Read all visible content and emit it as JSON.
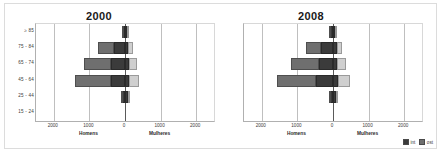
{
  "figure": {
    "border_color": "#dcdcdc",
    "background": "#ffffff"
  },
  "legend": {
    "items": [
      {
        "label": "int",
        "color": "#3b3b3b"
      },
      {
        "label": "ost",
        "color": "#6f6f6f"
      }
    ]
  },
  "axis": {
    "left_caption": "Homens",
    "right_caption": "Mulheres",
    "ticks": [
      "2000",
      "1000",
      "0",
      "1000",
      "2000"
    ],
    "age_groups": [
      "≥ 85",
      "75 - 84",
      "65 - 74",
      "45 - 64",
      "25 - 44",
      "15 - 24"
    ]
  },
  "chart_data": [
    {
      "type": "bar",
      "title": "2000",
      "subtype": "population-pyramid-stacked",
      "categories": [
        "≥ 85",
        "75 - 84",
        "65 - 74",
        "45 - 64",
        "25 - 44",
        "15 - 24"
      ],
      "xlabel": "",
      "ylabel": "",
      "xlim": [
        -2500,
        2500
      ],
      "xticks": [
        -2000,
        -1000,
        0,
        1000,
        2000
      ],
      "grid": true,
      "legend_position": "bottom-right",
      "series": [
        {
          "name": "int",
          "side": "Homens",
          "values": [
            60,
            310,
            380,
            400,
            90,
            0
          ]
        },
        {
          "name": "ost",
          "side": "Homens",
          "values": [
            20,
            450,
            760,
            1010,
            20,
            0
          ]
        },
        {
          "name": "int",
          "side": "Mulheres",
          "values": [
            55,
            95,
            110,
            120,
            75,
            0
          ]
        },
        {
          "name": "ost",
          "side": "Mulheres",
          "values": [
            15,
            140,
            230,
            280,
            15,
            0
          ]
        }
      ]
    },
    {
      "type": "bar",
      "title": "2008",
      "subtype": "population-pyramid-stacked",
      "categories": [
        "≥ 85",
        "75 - 84",
        "65 - 74",
        "45 - 64",
        "25 - 44",
        "15 - 24"
      ],
      "xlabel": "",
      "ylabel": "",
      "xlim": [
        -2500,
        2500
      ],
      "xticks": [
        -2000,
        -1000,
        0,
        1000,
        2000
      ],
      "grid": true,
      "legend_position": "bottom-right",
      "series": [
        {
          "name": "int",
          "side": "Homens",
          "values": [
            75,
            330,
            400,
            490,
            95,
            0
          ]
        },
        {
          "name": "ost",
          "side": "Homens",
          "values": [
            25,
            430,
            790,
            1080,
            25,
            0
          ]
        },
        {
          "name": "int",
          "side": "Mulheres",
          "values": [
            70,
            100,
            115,
            135,
            85,
            0
          ]
        },
        {
          "name": "ost",
          "side": "Mulheres",
          "values": [
            20,
            140,
            245,
            330,
            20,
            0
          ]
        }
      ]
    }
  ]
}
